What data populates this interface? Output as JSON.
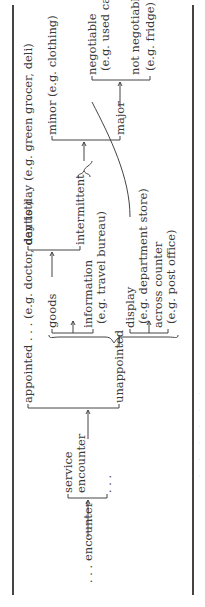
{
  "diagram": {
    "root": {
      "label": ". . . encounter"
    },
    "level1": [
      {
        "label": "service",
        "label2": "encounter"
      },
      {
        "label": ". . ."
      }
    ],
    "service_encounter": [
      {
        "label": "appointed . . . (e.g. doctor, dentist)"
      },
      {
        "label": "unappointed"
      }
    ],
    "unappointed_children": [
      {
        "label": "goods"
      },
      {
        "label": "information",
        "example": "(e.g. travel bureau)"
      },
      {
        "label": "display",
        "example": "(e.g. department store)"
      },
      {
        "label": "across counter",
        "example": "(e.g. post office)"
      }
    ],
    "goods_children": [
      {
        "label": "day to day (e.g. green grocer, deli)"
      },
      {
        "label": "intermittent"
      }
    ],
    "intermittent_children": [
      {
        "label": "minor (e.g. clothing)"
      },
      {
        "label": "major"
      }
    ],
    "major_children": [
      {
        "label": "negotiable",
        "example": "(e.g. used car)"
      },
      {
        "label": "not negotiable",
        "example": "(e.g. fridge)"
      }
    ],
    "brace_symbol": "}",
    "caption": "· · · · · ·",
    "colors": {
      "text": "#3a3a3a",
      "lines": "#444444",
      "background": "#ffffff"
    }
  }
}
